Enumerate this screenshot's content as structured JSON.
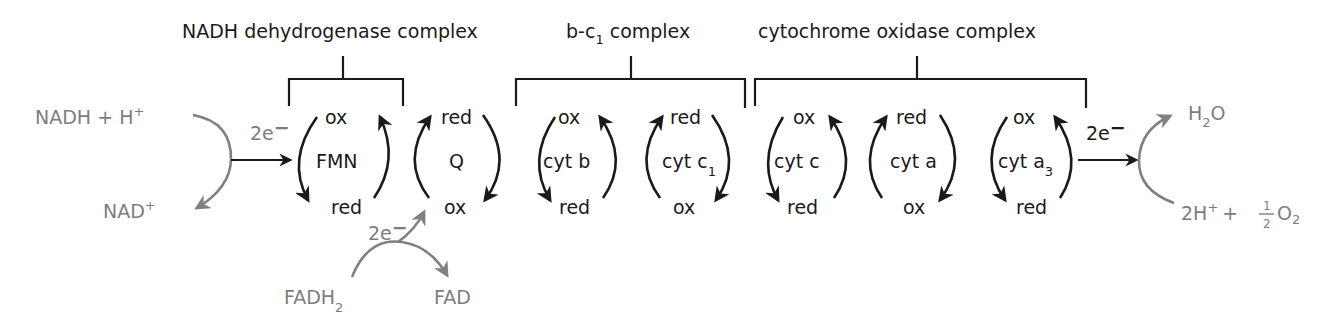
{
  "diagram": {
    "complexes": [
      {
        "label": "NADH dehydrogenase complex"
      },
      {
        "label": "b-c",
        "sub": "1",
        "suffix": " complex"
      },
      {
        "label": "cytochrome oxidase complex"
      }
    ],
    "carriers": [
      {
        "name": "FMN",
        "top": "ox",
        "bottom": "red"
      },
      {
        "name": "Q",
        "top": "red",
        "bottom": "ox"
      },
      {
        "name": "cyt b",
        "top": "ox",
        "bottom": "red"
      },
      {
        "name": "cyt c",
        "sub": "1",
        "top": "red",
        "bottom": "ox"
      },
      {
        "name": "cyt c",
        "top": "ox",
        "bottom": "red"
      },
      {
        "name": "cyt a",
        "top": "red",
        "bottom": "ox"
      },
      {
        "name": "cyt a",
        "sub": "3",
        "top": "ox",
        "bottom": "red"
      }
    ],
    "inputs": {
      "nadh": "NADH + H",
      "nadh_sup": "+",
      "nad": "NAD",
      "nad_sup": "+",
      "fadh2": "FADH",
      "fadh2_sub": "2",
      "fad": "FAD",
      "electrons": "2e",
      "electrons_sup": "−"
    },
    "outputs": {
      "water": "H",
      "water_sub": "2",
      "water_o": "O",
      "reactant_2h": "2H",
      "reactant_2h_sup": "+",
      "plus": "+",
      "half_num": "1",
      "half_den": "2",
      "o2": "O",
      "o2_sub": "2"
    },
    "colors": {
      "main": "#1a1a1a",
      "secondary": "#7d7d7d"
    }
  }
}
